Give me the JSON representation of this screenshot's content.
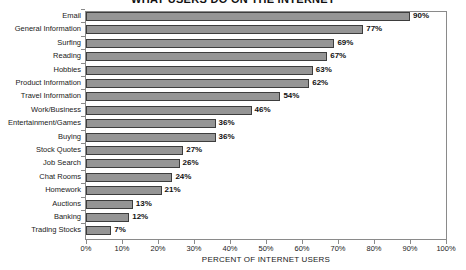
{
  "chart_data": {
    "type": "bar",
    "orientation": "horizontal",
    "title": "WHAT USERS DO ON THE INTERNET",
    "xlabel": "PERCENT OF INTERNET USERS",
    "ylabel": "",
    "categories": [
      "Email",
      "General Information",
      "Surfing",
      "Reading",
      "Hobbies",
      "Product Information",
      "Travel Information",
      "Work/Business",
      "Entertainment/Games",
      "Buying",
      "Stock Quotes",
      "Job Search",
      "Chat Rooms",
      "Homework",
      "Auctions",
      "Banking",
      "Trading Stocks"
    ],
    "values": [
      90,
      77,
      69,
      67,
      63,
      62,
      54,
      46,
      36,
      36,
      27,
      26,
      24,
      21,
      13,
      12,
      7
    ],
    "value_labels": [
      "90%",
      "77%",
      "69%",
      "67%",
      "63%",
      "62%",
      "54%",
      "46%",
      "36%",
      "36%",
      "27%",
      "26%",
      "24%",
      "21%",
      "13%",
      "12%",
      "7%"
    ],
    "xlim": [
      0,
      100
    ],
    "xticks": [
      0,
      10,
      20,
      30,
      40,
      50,
      60,
      70,
      80,
      90,
      100
    ],
    "xtick_labels": [
      "0%",
      "10%",
      "20%",
      "30%",
      "40%",
      "50%",
      "60%",
      "70%",
      "80%",
      "90%",
      "100%"
    ],
    "grid": false,
    "legend": null,
    "bar_color": "#959595",
    "bar_edge_color": "#3d3d3d",
    "axis_color": "#8a8a8a",
    "text_color": "#1a1a1a",
    "background": "#ffffff"
  }
}
